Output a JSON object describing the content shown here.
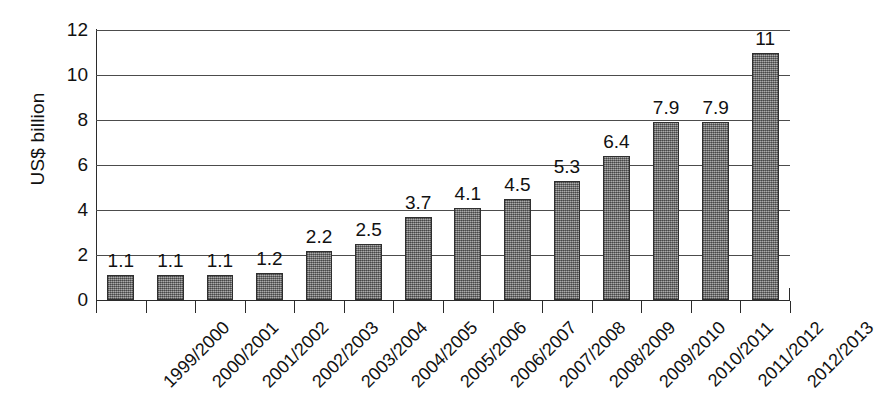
{
  "chart_data": {
    "type": "bar",
    "title": "",
    "subtitle": "",
    "xlabel": "",
    "ylabel": "US$ billion",
    "ylim": [
      0,
      12
    ],
    "y_ticks": [
      0,
      2,
      4,
      6,
      8,
      10,
      12
    ],
    "grid": true,
    "legend": false,
    "legend_position": "none",
    "bar_color": "#8a8a8a",
    "bar_edge_color": "#2f2f2f",
    "axis_color": "#2b2b2b",
    "gridline_color": "#4c4c4c",
    "background_color": "#ffffff",
    "categories": [
      "1999/2000",
      "2000/2001",
      "2001/2002",
      "2002/2003",
      "2003/2004",
      "2004/2005",
      "2005/2006",
      "2006/2007",
      "2007/2008",
      "2008/2009",
      "2009/2010",
      "2010/2011",
      "2011/2012",
      "2012/2013"
    ],
    "values": [
      1.1,
      1.1,
      1.1,
      1.2,
      2.2,
      2.5,
      3.7,
      4.1,
      4.5,
      5.3,
      6.4,
      7.9,
      7.9,
      11
    ],
    "value_labels": [
      "1.1",
      "1.1",
      "1.1",
      "1.2",
      "2.2",
      "2.5",
      "3.7",
      "4.1",
      "4.5",
      "5.3",
      "6.4",
      "7.9",
      "7.9",
      "11"
    ]
  },
  "axis": {
    "y_tick_labels": [
      "0",
      "2",
      "4",
      "6",
      "8",
      "10",
      "12"
    ],
    "y_title": "US$ billion"
  }
}
